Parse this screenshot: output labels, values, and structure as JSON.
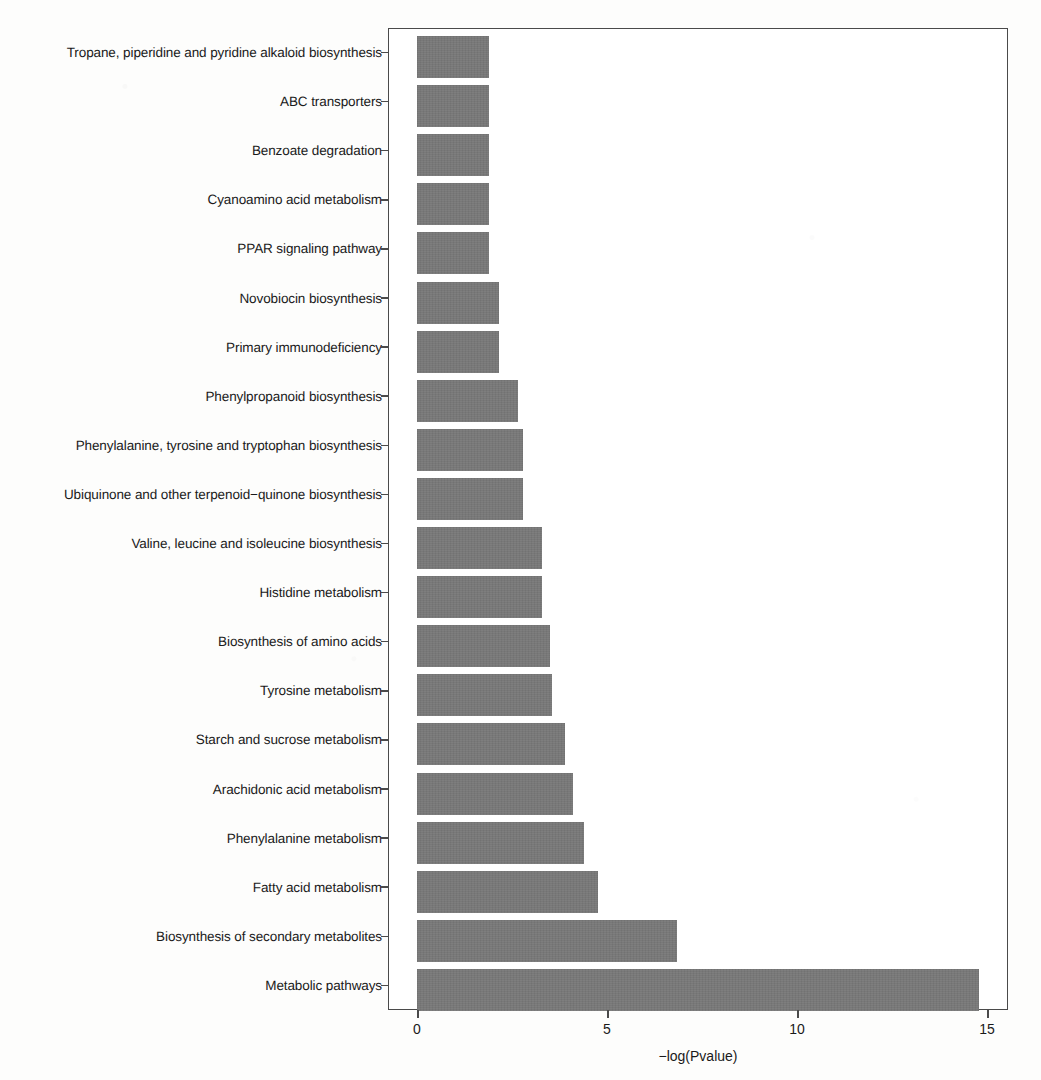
{
  "figure": {
    "background_color": "#fdfdfc",
    "bar_color": "#787878",
    "axis_color": "#4a4a4a"
  },
  "chart_data": {
    "type": "bar",
    "orientation": "horizontal",
    "title": "",
    "xlabel": "−log(Pvalue)",
    "ylabel": "",
    "xlim": [
      0,
      15
    ],
    "xticks": [
      0,
      5,
      10,
      15
    ],
    "xtick_labels": [
      "0",
      "5",
      "10",
      "15"
    ],
    "grid": false,
    "legend": null,
    "categories": [
      "Tropane, piperidine and pyridine alkaloid biosynthesis",
      "ABC transporters",
      "Benzoate degradation",
      "Cyanoamino acid metabolism",
      "PPAR signaling pathway",
      "Novobiocin biosynthesis",
      "Primary immunodeficiency",
      "Phenylpropanoid biosynthesis",
      "Phenylalanine, tyrosine and tryptophan biosynthesis",
      "Ubiquinone and other terpenoid−quinone biosynthesis",
      "Valine, leucine and isoleucine biosynthesis",
      "Histidine metabolism",
      "Biosynthesis of amino acids",
      "Tyrosine metabolism",
      "Starch and sucrose metabolism",
      "Arachidonic acid metabolism",
      "Phenylalanine metabolism",
      "Fatty acid metabolism",
      "Biosynthesis of secondary metabolites",
      "Metabolic pathways"
    ],
    "values": [
      1.9,
      1.9,
      1.9,
      1.9,
      1.9,
      2.15,
      2.15,
      2.65,
      2.8,
      2.8,
      3.3,
      3.3,
      3.5,
      3.55,
      3.9,
      4.1,
      4.4,
      4.75,
      6.85,
      14.8
    ]
  }
}
